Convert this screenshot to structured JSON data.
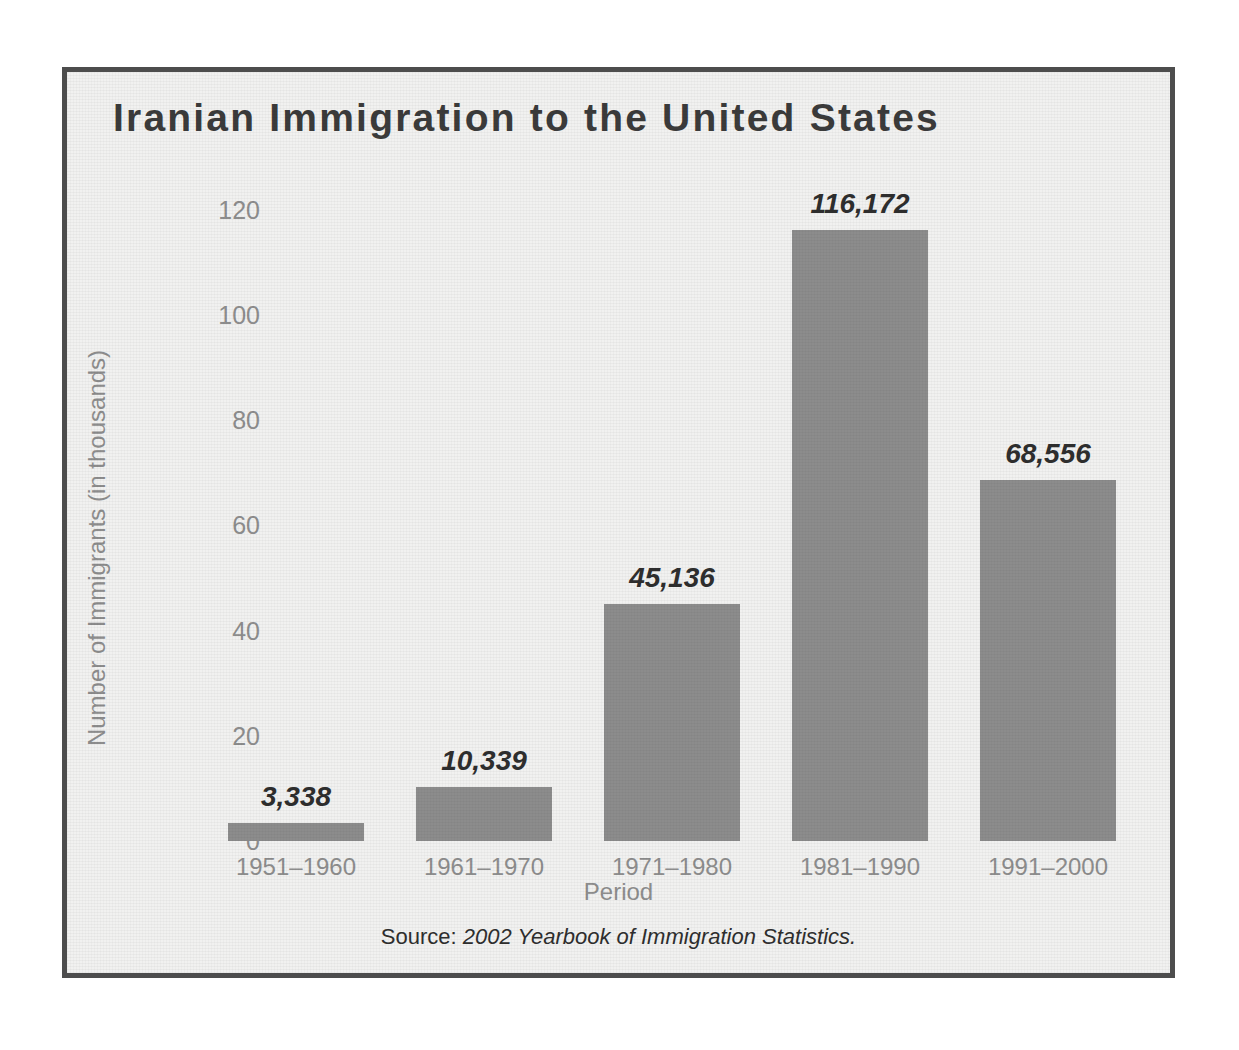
{
  "figure": {
    "title": "Iranian Immigration to the United States",
    "source_prefix": "Source:",
    "source_title": "2002 Yearbook of Immigration Statistics.",
    "frame_color": "#4d4d4d",
    "background_color": "#f1f1f0"
  },
  "chart_data": {
    "type": "bar",
    "title": "Iranian Immigration to the United States",
    "xlabel": "Period",
    "ylabel": "Number of Immigrants (in thousands)",
    "categories": [
      "1951–1960",
      "1961–1970",
      "1971–1980",
      "1981–1990",
      "1991–2000"
    ],
    "values": [
      3.338,
      10.339,
      45.136,
      116.172,
      68.556
    ],
    "value_labels": [
      "3,338",
      "10,339",
      "45,136",
      "116,172",
      "68,556"
    ],
    "raw_values": [
      3338,
      10339,
      45136,
      116172,
      68556
    ],
    "ylim": [
      0,
      126
    ],
    "yticks": [
      0,
      20,
      40,
      60,
      80,
      100,
      120
    ],
    "ytick_labels": [
      "0",
      "20",
      "40",
      "60",
      "80",
      "100",
      "120"
    ],
    "grid": false,
    "legend": false,
    "bar_color": "#8c8c8c",
    "label_color": "#8d8d8d",
    "value_label_color": "#2e2e2e"
  }
}
